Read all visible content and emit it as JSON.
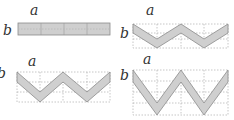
{
  "diagram": {
    "colors": {
      "band_fill": "#cfcfcf",
      "band_stroke": "#8a8a8a",
      "grid": "#b8b8b8",
      "label": "#333333"
    },
    "panels": [
      {
        "id": "flat",
        "label_a": "a",
        "label_b": "b",
        "segments": 4
      },
      {
        "id": "zigzag-small",
        "label_a": "a",
        "label_b": "b",
        "segments": 4
      },
      {
        "id": "zigzag-medium",
        "label_a": "a",
        "label_b": "b",
        "segments": 4
      },
      {
        "id": "zigzag-large",
        "label_a": "a",
        "label_b": "b",
        "segments": 4
      }
    ]
  }
}
